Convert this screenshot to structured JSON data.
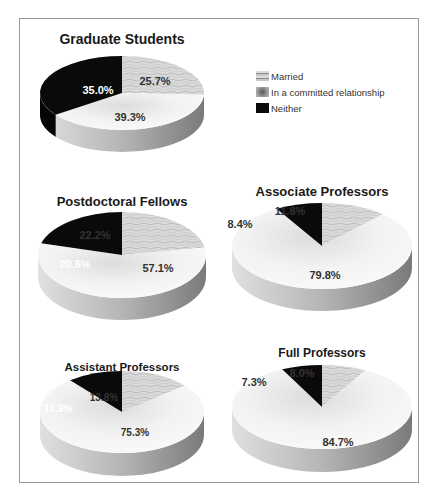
{
  "legend": {
    "items": [
      {
        "key": "married",
        "label": "Married"
      },
      {
        "key": "committed",
        "label": "In a committed relationship"
      },
      {
        "key": "neither",
        "label": "Neither"
      }
    ]
  },
  "colors": {
    "married": "#d4d4d4",
    "committed": "#ededed",
    "neither": "#0a0a0a",
    "side": "#9a9a9a",
    "frame": "#9a9a9a"
  },
  "charts": {
    "grad": {
      "title": "Graduate Students",
      "married": "25.7%",
      "committed": "39.3%",
      "neither": "35.0%"
    },
    "postdoc": {
      "title": "Postdoctoral Fellows",
      "married": "22.2%",
      "committed": "57.1%",
      "neither": "20.6%"
    },
    "associate": {
      "title": "Associate Professors",
      "married": "11.8%",
      "committed": "79.8%",
      "neither": "8.4%"
    },
    "assistant": {
      "title": "Assistant Professors",
      "married": "13.8%",
      "committed": "75.3%",
      "neither": "10.9%"
    },
    "full": {
      "title": "Full Professors",
      "married": "8.0%",
      "committed": "84.7%",
      "neither": "7.3%"
    }
  },
  "chart_data": [
    {
      "type": "pie",
      "title": "Graduate Students",
      "categories": [
        "Married",
        "In a committed relationship",
        "Neither"
      ],
      "values": [
        25.7,
        39.3,
        35.0
      ],
      "legend_position": "right"
    },
    {
      "type": "pie",
      "title": "Postdoctoral Fellows",
      "categories": [
        "Married",
        "In a committed relationship",
        "Neither"
      ],
      "values": [
        22.2,
        57.1,
        20.6
      ]
    },
    {
      "type": "pie",
      "title": "Associate Professors",
      "categories": [
        "Married",
        "In a committed relationship",
        "Neither"
      ],
      "values": [
        11.8,
        79.8,
        8.4
      ]
    },
    {
      "type": "pie",
      "title": "Assistant Professors",
      "categories": [
        "Married",
        "In a committed relationship",
        "Neither"
      ],
      "values": [
        13.8,
        75.3,
        10.9
      ]
    },
    {
      "type": "pie",
      "title": "Full Professors",
      "categories": [
        "Married",
        "In a committed relationship",
        "Neither"
      ],
      "values": [
        8.0,
        84.7,
        7.3
      ]
    }
  ]
}
